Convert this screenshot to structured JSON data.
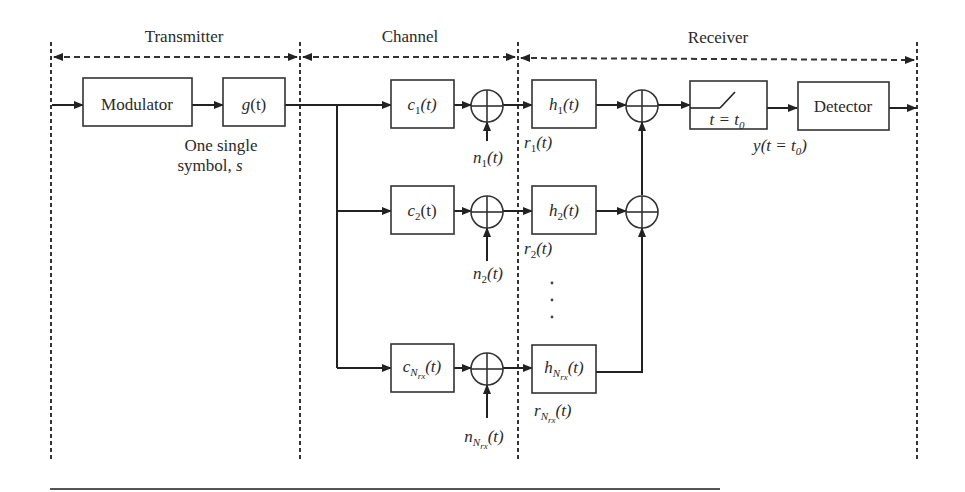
{
  "sections": {
    "transmitter": "Transmitter",
    "channel": "Channel",
    "receiver": "Receiver"
  },
  "blocks": {
    "modulator": "Modulator",
    "g": {
      "base": "g",
      "arg": "(t)"
    },
    "c1": {
      "base": "c",
      "sub": "1",
      "arg": "(t)"
    },
    "c2": {
      "base": "c",
      "sub": "2",
      "arg": "(t)"
    },
    "cN": {
      "base": "c",
      "sub": "N",
      "subsub": "rx",
      "arg": "(t)"
    },
    "h1": {
      "base": "h",
      "sub": "1",
      "arg": "(t)"
    },
    "h2": {
      "base": "h",
      "sub": "2",
      "arg": "(t)"
    },
    "hN": {
      "base": "h",
      "sub": "N",
      "subsub": "rx",
      "arg": "(t)"
    },
    "sampler": {
      "lhs": "t = t",
      "sub": "0"
    },
    "detector": "Detector"
  },
  "labels": {
    "symbol_line1": "One single",
    "symbol_line2": "symbol, ",
    "symbol_var": "s",
    "n1": {
      "base": "n",
      "sub": "1",
      "arg": "(t)"
    },
    "n2": {
      "base": "n",
      "sub": "2",
      "arg": "(t)"
    },
    "nN": {
      "base": "n",
      "sub": "N",
      "subsub": "rx",
      "arg": "(t)"
    },
    "r1": {
      "base": "r",
      "sub": "1",
      "arg": "(t)"
    },
    "r2": {
      "base": "r",
      "sub": "2",
      "arg": "(t)"
    },
    "rN": {
      "base": "r",
      "sub": "N",
      "subsub": "rx",
      "arg": "(t)"
    },
    "y": {
      "pre": "y(t = t",
      "sub": "0",
      "post": ")"
    },
    "ellipsis": "⋮"
  }
}
